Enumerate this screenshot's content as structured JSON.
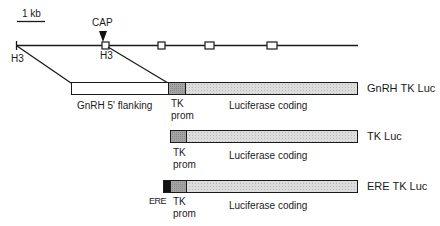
{
  "scale_bar": {
    "label": "1 kb"
  },
  "gene_map": {
    "cap_label": "CAP",
    "h3_left": "H3",
    "h3_cap": "H3"
  },
  "constructs": [
    {
      "name": "GnRH TK Luc",
      "segments": [
        {
          "label": "GnRH 5' flanking",
          "fill": "#ffffff"
        },
        {
          "label_line1": "TK",
          "label_line2": "prom",
          "fill": "#9a9a9a"
        },
        {
          "label": "Luciferase coding",
          "fill": "#d6d6d6"
        }
      ]
    },
    {
      "name": "TK Luc",
      "segments": [
        {
          "label_line1": "TK",
          "label_line2": "prom",
          "fill": "#9a9a9a"
        },
        {
          "label": "Luciferase coding",
          "fill": "#d6d6d6"
        }
      ]
    },
    {
      "name": "ERE TK Luc",
      "segments": [
        {
          "label": "ERE",
          "fill": "#111111"
        },
        {
          "label_line1": "TK",
          "label_line2": "prom",
          "fill": "#9a9a9a"
        },
        {
          "label": "Luciferase coding",
          "fill": "#d6d6d6"
        }
      ]
    }
  ],
  "colors": {
    "line": "#1a1a1a",
    "tk_prom": "#9a9a9a",
    "luciferase": "#d6d6d6",
    "ere": "#111111"
  }
}
